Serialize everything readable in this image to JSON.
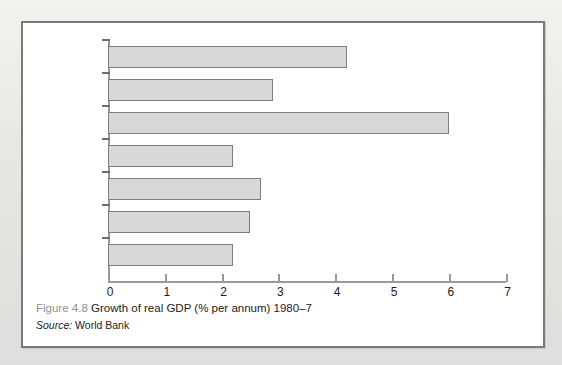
{
  "figure": {
    "caption_number": "Figure 4.8",
    "caption_text": "Growth of real GDP (% per annum) 1980–7",
    "source_label": "Source:",
    "source_value": "World Bank"
  },
  "chart_data": {
    "type": "bar",
    "orientation": "horizontal",
    "title": "Growth of real GDP (% per annum) 1980–7",
    "xlabel": "",
    "ylabel": "",
    "xlim": [
      0,
      7
    ],
    "xticks": [
      "0",
      "1",
      "2",
      "3",
      "4",
      "5",
      "6",
      "7"
    ],
    "grid": false,
    "legend": "none",
    "categories": [
      "Ireland",
      "US",
      "East Asia",
      "EU",
      "Japan",
      "OECD",
      "UK"
    ],
    "values": [
      4.2,
      2.9,
      6.0,
      2.2,
      2.7,
      2.5,
      2.2
    ],
    "bar_fill_color": "#d8d8d8",
    "bar_border_color": "#7d7d7d",
    "axis_color": "#9a9a9a"
  }
}
